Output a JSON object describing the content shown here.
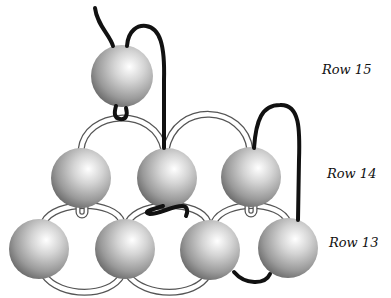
{
  "diagram": {
    "type": "bead-weaving",
    "labels": [
      {
        "id": "row15",
        "text": "Row 15",
        "x": 322,
        "y": 62
      },
      {
        "id": "row14",
        "text": "Row 14",
        "x": 327,
        "y": 166
      },
      {
        "id": "row13",
        "text": "Row 13",
        "x": 329,
        "y": 235
      }
    ],
    "beads": [
      {
        "row": 15,
        "cx": 122,
        "cy": 76,
        "r": 31
      },
      {
        "row": 14,
        "cx": 81,
        "cy": 178,
        "r": 30
      },
      {
        "row": 14,
        "cx": 167,
        "cy": 178,
        "r": 30
      },
      {
        "row": 14,
        "cx": 251,
        "cy": 177,
        "r": 30
      },
      {
        "row": 13,
        "cx": 39,
        "cy": 249,
        "r": 30
      },
      {
        "row": 13,
        "cx": 125,
        "cy": 249,
        "r": 30
      },
      {
        "row": 13,
        "cx": 210,
        "cy": 250,
        "r": 30
      },
      {
        "row": 13,
        "cx": 288,
        "cy": 248,
        "r": 30
      }
    ],
    "colors": {
      "thread_active": "#111111",
      "thread_passive_outline": "#555555",
      "bead_light": "#ffffff",
      "bead_dark": "#6a6a6a"
    }
  }
}
